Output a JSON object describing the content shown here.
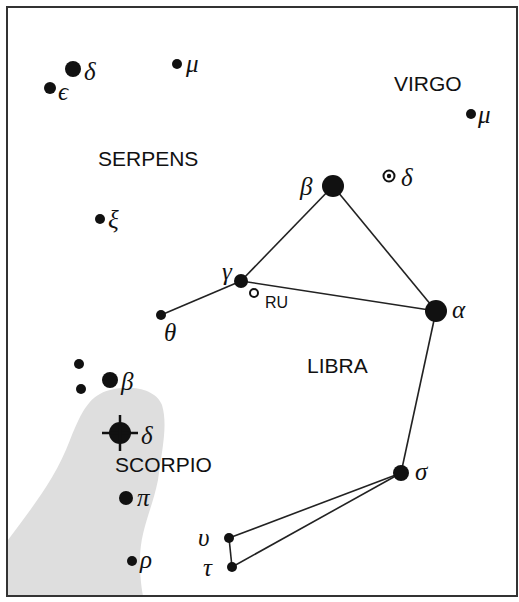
{
  "constellations": {
    "virgo": "VIRGO",
    "serpens": "SERPENS",
    "libra": "LIBRA",
    "scorpio": "SCORPIO"
  },
  "stars": {
    "serpens_delta": "δ",
    "serpens_epsilon": "ϵ",
    "serpens_mu": "μ",
    "serpens_xi": "ξ",
    "virgo_mu": "μ",
    "virgo_delta": "δ",
    "libra_beta": "β",
    "libra_gamma": "γ",
    "libra_theta": "θ",
    "libra_alpha": "α",
    "libra_sigma": "σ",
    "libra_upsilon": "υ",
    "libra_tau": "τ",
    "libra_ru": "RU",
    "scorpio_beta": "β",
    "scorpio_delta": "δ",
    "scorpio_pi": "π",
    "scorpio_rho": "ρ"
  },
  "colors": {
    "ink": "#111111",
    "shade": "#dedede",
    "frame": "#333333"
  }
}
